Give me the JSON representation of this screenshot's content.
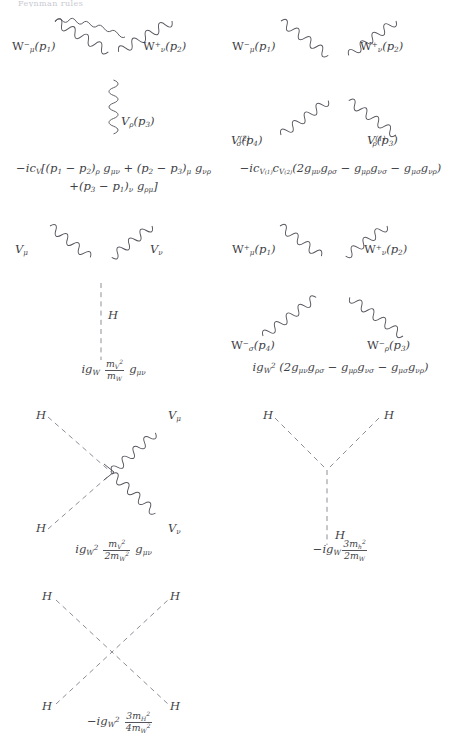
{
  "page": {
    "running_header": "Feynman rules",
    "width": 454,
    "height": 751,
    "ink_color": "#3f3f47",
    "wave_color": "#55555e",
    "dash_color": "#8d8d97"
  },
  "diagrams": [
    {
      "id": "wwv-triple-gauge",
      "name": "triple-gauge-vertex",
      "type": "three-point",
      "legs": [
        {
          "key": "l1",
          "text_parts": [
            "W",
            "−",
            "μ",
            "(p",
            "1",
            ")"
          ],
          "plain": "W−μ(p1)"
        },
        {
          "key": "l2",
          "text_parts": [
            "W",
            "+",
            "ν",
            "(p",
            "2",
            ")"
          ],
          "plain": "W+ν(p2)"
        },
        {
          "key": "l3",
          "text_parts": [
            "V",
            "ρ",
            "(p",
            "3",
            ")"
          ],
          "plain": "Vρ(p3)"
        }
      ],
      "formula_line1": "−ic_V[(p1 − p2)ρ gμν + (p2 − p3)μ gνρ",
      "formula_line2": "+(p3 − p1)ν gρμ]"
    },
    {
      "id": "wwvv-quartic-gauge",
      "name": "quartic-gauge-vertex",
      "type": "four-point",
      "legs": [
        {
          "key": "l1",
          "plain": "W−μ(p1)"
        },
        {
          "key": "l2",
          "plain": "W+ν(p2)"
        },
        {
          "key": "l3",
          "plain": "V(2)σ(p4)"
        },
        {
          "key": "l4",
          "plain": "V(1)ρ(p3)"
        }
      ],
      "formula_line1": "−ic_V(1) c_V(2) (2gμν gρσ − gμρ gνσ − gμσ gνρ)"
    },
    {
      "id": "hvv",
      "name": "higgs-vector-vector-vertex",
      "type": "three-point",
      "legs": [
        {
          "key": "l1",
          "plain": "Vμ"
        },
        {
          "key": "l2",
          "plain": "Vν"
        },
        {
          "key": "l3",
          "plain": "H"
        }
      ],
      "formula_line1": "ig_W (m_V² / m_W) gμν"
    },
    {
      "id": "wwww",
      "name": "four-w-vertex",
      "type": "four-point",
      "legs": [
        {
          "key": "l1",
          "plain": "W+μ(p1)"
        },
        {
          "key": "l2",
          "plain": "W+ν(p2)"
        },
        {
          "key": "l3",
          "plain": "W−σ(p4)"
        },
        {
          "key": "l4",
          "plain": "W−ρ(p3)"
        }
      ],
      "formula_line1": "ig_W² (2gμν gρσ − gμρ gνσ − gμσ gνρ)"
    },
    {
      "id": "hhvv",
      "name": "higgs-higgs-vector-vector-vertex",
      "type": "four-point",
      "legs": [
        {
          "key": "l1",
          "plain": "H"
        },
        {
          "key": "l2",
          "plain": "Vμ"
        },
        {
          "key": "l3",
          "plain": "H"
        },
        {
          "key": "l4",
          "plain": "Vν"
        }
      ],
      "formula_line1": "ig_W² (m_V² / 2m_W²) gμν"
    },
    {
      "id": "hhh",
      "name": "triple-higgs-vertex",
      "type": "three-point",
      "legs": [
        {
          "key": "l1",
          "plain": "H"
        },
        {
          "key": "l2",
          "plain": "H"
        },
        {
          "key": "l3",
          "plain": "H"
        }
      ],
      "formula_line1": "−ig_W (3m_h² / 2m_W)"
    },
    {
      "id": "hhhh",
      "name": "quartic-higgs-vertex",
      "type": "four-point",
      "legs": [
        {
          "key": "l1",
          "plain": "H"
        },
        {
          "key": "l2",
          "plain": "H"
        },
        {
          "key": "l3",
          "plain": "H"
        },
        {
          "key": "l4",
          "plain": "H"
        }
      ],
      "formula_line1": "−ig_W² (3m_H² / 4m_W²)"
    }
  ],
  "labels": {
    "W": "W",
    "V": "V",
    "H": "H",
    "p": "p",
    "g": "g",
    "m": "m",
    "c": "c",
    "i": "i",
    "minus": "−",
    "plus": "+",
    "mu": "μ",
    "nu": "ν",
    "rho": "ρ",
    "sigma": "σ",
    "one": "1",
    "two": "2",
    "three": "3",
    "four": "4",
    "W_sub": "W",
    "V_sub": "V",
    "h_sub": "h",
    "H_sub": "H",
    "three_m": "3m",
    "two_m": "2m",
    "four_m": "4m",
    "open_br": "[",
    "close_br": "]",
    "open_p": "(",
    "close_p": ")"
  }
}
